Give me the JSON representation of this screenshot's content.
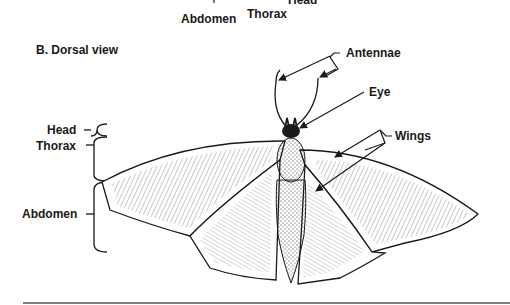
{
  "top_labels": {
    "head": "Head",
    "abdomen": "Abdomen",
    "thorax": "Thorax"
  },
  "section": {
    "title": "B. Dorsal view"
  },
  "left_labels": {
    "head": "Head",
    "thorax": "Thorax",
    "abdomen": "Abdomen"
  },
  "callouts": {
    "antennae": "Antennae",
    "eye": "Eye",
    "wings": "Wings"
  },
  "colors": {
    "ink": "#1a1a1a",
    "background": "#ffffff",
    "rule": "#555555"
  }
}
